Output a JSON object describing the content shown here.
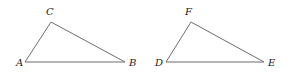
{
  "figure": {
    "colors": {
      "edge": "#6e6e6e",
      "label": "#222222",
      "background": "#ffffff"
    },
    "triangles": [
      {
        "name": "ABC",
        "vertices": [
          {
            "label": "A",
            "x": 25,
            "y": 62,
            "lx": 16,
            "ly": 66
          },
          {
            "label": "B",
            "x": 125,
            "y": 62,
            "lx": 129,
            "ly": 66
          },
          {
            "label": "C",
            "x": 51,
            "y": 22,
            "lx": 46,
            "ly": 15
          }
        ]
      },
      {
        "name": "DEF",
        "vertices": [
          {
            "label": "D",
            "x": 166,
            "y": 62,
            "lx": 155,
            "ly": 66
          },
          {
            "label": "E",
            "x": 264,
            "y": 62,
            "lx": 268,
            "ly": 66
          },
          {
            "label": "F",
            "x": 191,
            "y": 22,
            "lx": 185,
            "ly": 15
          }
        ]
      }
    ]
  }
}
